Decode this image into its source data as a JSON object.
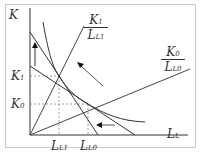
{
  "diagram": {
    "type": "isoquant-isocost factor substitution diagram",
    "axes": {
      "y_label": "K",
      "x_label": "L",
      "x_label_sub": "L"
    },
    "y_ticks": [
      {
        "main": "K",
        "sub": "1"
      },
      {
        "main": "K",
        "sub": "0"
      }
    ],
    "x_ticks": [
      {
        "main": "L",
        "sub": "L1"
      },
      {
        "main": "L",
        "sub": "L0"
      }
    ],
    "rays": [
      {
        "num_main": "K",
        "num_sub": "1",
        "den_main": "L",
        "den_sub": "L1"
      },
      {
        "num_main": "K",
        "num_sub": "0",
        "den_main": "L",
        "den_sub": "L0"
      }
    ],
    "elements": [
      "isoquant curve",
      "steep isocost line",
      "flat isocost line",
      "up arrow",
      "diagonal arrow",
      "left arrow",
      "dashed guide lines"
    ],
    "colors": {
      "line": "#333333",
      "dash": "#888888",
      "frame": "#c8c8c8"
    }
  },
  "caption": ""
}
